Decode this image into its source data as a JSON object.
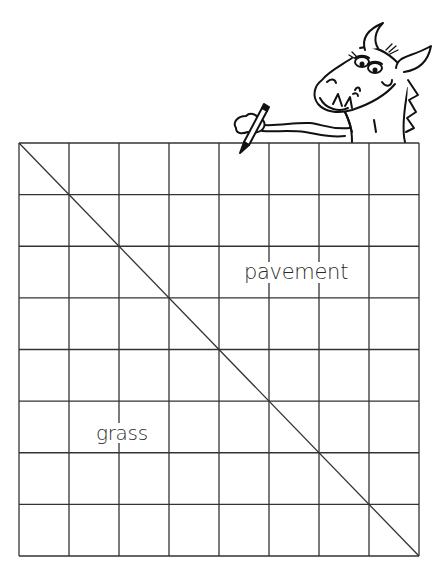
{
  "diagram": {
    "type": "grid-with-diagonal",
    "grid": {
      "rows": 8,
      "columns": 8,
      "left": 19,
      "top": 143,
      "right": 419,
      "bottom": 556,
      "line_color": "#333333"
    },
    "diagonal": {
      "from": "top-left",
      "to": "bottom-right"
    },
    "regions": [
      {
        "name": "pavement",
        "label": "pavement",
        "position": "upper-right triangle"
      },
      {
        "name": "grass",
        "label": "grass",
        "position": "lower-left triangle"
      }
    ],
    "illustration": {
      "name": "dragon",
      "description": "cartoon dragon with pencil peeking over top-right of grid"
    }
  },
  "labels": {
    "pavement": "pavement",
    "grass": "grass"
  }
}
